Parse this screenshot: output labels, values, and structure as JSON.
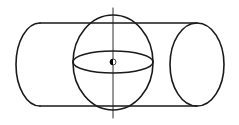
{
  "diagram": {
    "colors": {
      "background": "#ffffff",
      "stroke": "#1a1a1a",
      "center_fill": "#000000"
    },
    "stroke_width": 1.6,
    "axis": {
      "x": 113,
      "y1": 8,
      "y2": 118,
      "stroke_width": 0.9
    },
    "cylinder": {
      "top_y": 23,
      "bottom_y": 106,
      "left_x": 40,
      "right_x": 197,
      "left_cap_bulge_x": 16,
      "right_ellipse": {
        "cx": 197,
        "cy": 64.5,
        "rx": 27,
        "ry": 41.5
      }
    },
    "sphere": {
      "cx": 113,
      "cy": 62.5,
      "rx": 40,
      "ry": 47.5
    },
    "equator": {
      "cx": 113,
      "cy": 62,
      "rx": 40,
      "ry": 11
    },
    "center_point": {
      "cx": 113,
      "cy": 62,
      "r": 3
    }
  }
}
